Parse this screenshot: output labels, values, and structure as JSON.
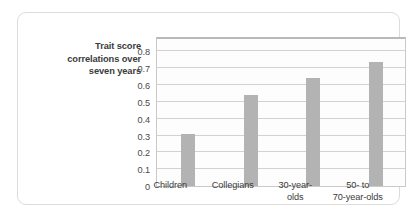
{
  "chart_data": {
    "type": "bar",
    "title": "",
    "subtitle": "",
    "xlabel": "",
    "ylabel": "Trait score correlations over seven years",
    "ylabel_lines": [
      "Trait score",
      "correlations over",
      "seven years"
    ],
    "categories": [
      "Children",
      "Collegians",
      "30-year-olds",
      "50- to 70-year-olds"
    ],
    "category_lines": [
      [
        "Children"
      ],
      [
        "Collegians"
      ],
      [
        "30-year-",
        "olds"
      ],
      [
        "50- to",
        "70-year-olds"
      ]
    ],
    "values": [
      0.31,
      0.54,
      0.64,
      0.74
    ],
    "ylim": [
      0,
      0.88
    ],
    "yticks": [
      0,
      0.1,
      0.2,
      0.3,
      0.4,
      0.5,
      0.6,
      0.7,
      0.8
    ],
    "ytick_labels": [
      "0",
      "0.1",
      "0.2",
      "0.3",
      "0.4",
      "0.5",
      "0.6",
      "0.7",
      "0.8"
    ],
    "grid": true,
    "grid_axis": "y",
    "legend": false,
    "legend_position": "none",
    "bar_color": "#b3b3b3",
    "grid_color": "#d2d2d2",
    "plot_border_color": "#c9c9c9",
    "background_color": "#ffffff",
    "card_border_color": "#dcdcdc",
    "text_color": "#3b3b3b"
  }
}
